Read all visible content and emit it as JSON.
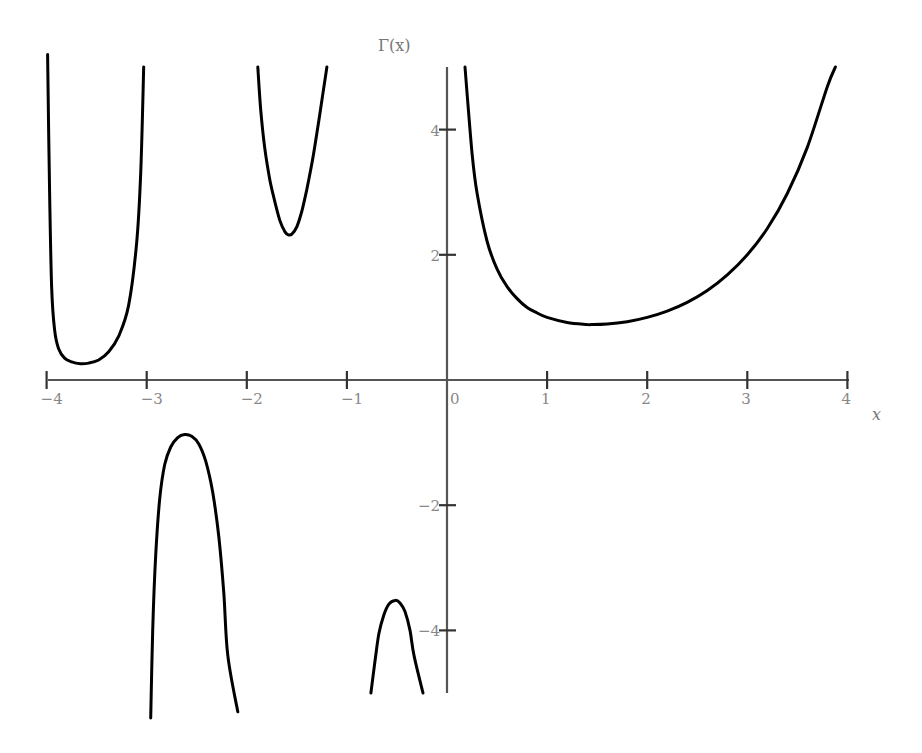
{
  "chart_data": {
    "type": "line",
    "title": "",
    "xlabel": "x",
    "ylabel": "Γ(x)",
    "xlim": [
      -4,
      4
    ],
    "ylim": [
      -5,
      5
    ],
    "grid": false,
    "legend": null,
    "x_ticks": [
      -4,
      -3,
      -2,
      -1,
      0,
      1,
      2,
      3,
      4
    ],
    "x_tick_labels": [
      "−4",
      "−3",
      "−2",
      "−1",
      "0",
      "1",
      "2",
      "3",
      "4"
    ],
    "y_ticks": [
      -4,
      -2,
      2,
      4
    ],
    "y_tick_labels": [
      "−4",
      "−2",
      "2",
      "4"
    ],
    "series": [
      {
        "name": "Γ(x) on (−4,−3)",
        "points": [
          [
            -3.99,
            5.2
          ],
          [
            -3.97,
            3.0
          ],
          [
            -3.95,
            1.5
          ],
          [
            -3.92,
            0.8
          ],
          [
            -3.88,
            0.5
          ],
          [
            -3.82,
            0.35
          ],
          [
            -3.75,
            0.29
          ],
          [
            -3.66,
            0.26
          ],
          [
            -3.58,
            0.27
          ],
          [
            -3.48,
            0.32
          ],
          [
            -3.38,
            0.45
          ],
          [
            -3.28,
            0.7
          ],
          [
            -3.18,
            1.2
          ],
          [
            -3.1,
            2.2
          ],
          [
            -3.06,
            3.3
          ],
          [
            -3.03,
            5.0
          ]
        ]
      },
      {
        "name": "Γ(x) on (−3,−2)",
        "points": [
          [
            -2.96,
            -5.4
          ],
          [
            -2.94,
            -4.0
          ],
          [
            -2.91,
            -2.8
          ],
          [
            -2.87,
            -1.9
          ],
          [
            -2.82,
            -1.35
          ],
          [
            -2.76,
            -1.07
          ],
          [
            -2.69,
            -0.92
          ],
          [
            -2.62,
            -0.87
          ],
          [
            -2.55,
            -0.9
          ],
          [
            -2.48,
            -1.02
          ],
          [
            -2.41,
            -1.3
          ],
          [
            -2.34,
            -1.8
          ],
          [
            -2.28,
            -2.5
          ],
          [
            -2.23,
            -3.4
          ],
          [
            -2.19,
            -4.4
          ],
          [
            -2.09,
            -5.3
          ]
        ]
      },
      {
        "name": "Γ(x) on (−2,−1)",
        "points": [
          [
            -1.89,
            5.0
          ],
          [
            -1.86,
            4.3
          ],
          [
            -1.82,
            3.7
          ],
          [
            -1.77,
            3.2
          ],
          [
            -1.72,
            2.85
          ],
          [
            -1.67,
            2.55
          ],
          [
            -1.62,
            2.37
          ],
          [
            -1.585,
            2.32
          ],
          [
            -1.55,
            2.33
          ],
          [
            -1.5,
            2.45
          ],
          [
            -1.45,
            2.7
          ],
          [
            -1.4,
            3.05
          ],
          [
            -1.34,
            3.55
          ],
          [
            -1.28,
            4.15
          ],
          [
            -1.2,
            5.0
          ]
        ]
      },
      {
        "name": "Γ(x) on (−1,0)",
        "points": [
          [
            -0.76,
            -5.0
          ],
          [
            -0.72,
            -4.5
          ],
          [
            -0.68,
            -4.05
          ],
          [
            -0.63,
            -3.75
          ],
          [
            -0.58,
            -3.58
          ],
          [
            -0.52,
            -3.52
          ],
          [
            -0.47,
            -3.56
          ],
          [
            -0.42,
            -3.7
          ],
          [
            -0.37,
            -4.0
          ],
          [
            -0.33,
            -4.4
          ],
          [
            -0.24,
            -5.0
          ]
        ]
      },
      {
        "name": "Γ(x) on (0,4)",
        "points": [
          [
            0.18,
            5.0
          ],
          [
            0.2,
            4.59
          ],
          [
            0.25,
            3.63
          ],
          [
            0.3,
            2.99
          ],
          [
            0.4,
            2.22
          ],
          [
            0.5,
            1.77
          ],
          [
            0.6,
            1.49
          ],
          [
            0.7,
            1.3
          ],
          [
            0.8,
            1.16
          ],
          [
            0.9,
            1.07
          ],
          [
            1.0,
            1.0
          ],
          [
            1.2,
            0.92
          ],
          [
            1.4,
            0.887
          ],
          [
            1.46,
            0.886
          ],
          [
            1.6,
            0.894
          ],
          [
            1.8,
            0.931
          ],
          [
            2.0,
            1.0
          ],
          [
            2.2,
            1.1
          ],
          [
            2.4,
            1.24
          ],
          [
            2.6,
            1.43
          ],
          [
            2.8,
            1.68
          ],
          [
            3.0,
            2.0
          ],
          [
            3.2,
            2.42
          ],
          [
            3.4,
            2.98
          ],
          [
            3.6,
            3.72
          ],
          [
            3.8,
            4.69
          ],
          [
            3.88,
            5.0
          ]
        ]
      }
    ],
    "annotations": [
      "Γ(x)",
      "x"
    ]
  },
  "labels": {
    "y_axis_title": "Γ(x)",
    "x_axis_title": "x"
  }
}
